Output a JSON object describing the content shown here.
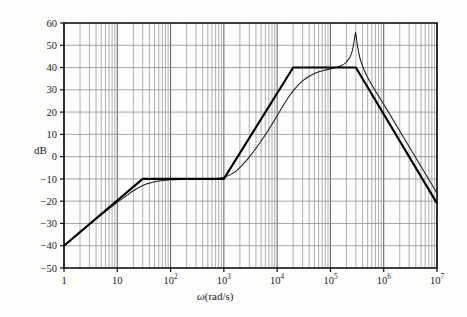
{
  "figure": {
    "kind": "bode-magnitude-plot",
    "background_color": "#fdfdfb",
    "frame_color": "#111111",
    "grid_color": "#8a8a8a",
    "curve_color": "#000000",
    "asymptote_color": "#000000"
  },
  "axes": {
    "y_label": "dB",
    "x_label_omega": "ω",
    "x_label_units": "(rad/s)",
    "y_ticks": [
      "60",
      "50",
      "40",
      "30",
      "20",
      "10",
      "0",
      "−10",
      "−20",
      "−30",
      "−40",
      "−50"
    ],
    "x_tick_labels": [
      {
        "mantissa": "1",
        "exponent": ""
      },
      {
        "mantissa": "10",
        "exponent": ""
      },
      {
        "mantissa": "10",
        "exponent": "2"
      },
      {
        "mantissa": "10",
        "exponent": "3"
      },
      {
        "mantissa": "10",
        "exponent": "4"
      },
      {
        "mantissa": "10",
        "exponent": "5"
      },
      {
        "mantissa": "10",
        "exponent": "6"
      },
      {
        "mantissa": "10",
        "exponent": "7"
      }
    ]
  },
  "chart_data": {
    "type": "line",
    "title": "",
    "xlabel": "ω(rad/s)",
    "ylabel": "dB",
    "xscale": "log",
    "yscale": "linear",
    "xlim": [
      1,
      10000000
    ],
    "ylim": [
      -50,
      60
    ],
    "ytick_values": [
      -50,
      -40,
      -30,
      -20,
      -10,
      0,
      10,
      20,
      30,
      40,
      50,
      60
    ],
    "xtick_values": [
      1,
      10,
      100,
      1000,
      10000,
      100000,
      1000000,
      10000000
    ],
    "grid": true,
    "grid_minor": true,
    "legend": "none",
    "series": [
      {
        "name": "Asymptotic approximation",
        "style": "thick-straight-segments",
        "breakpoints": [
          {
            "x": 1,
            "y": -40
          },
          {
            "x": 30,
            "y": -10
          },
          {
            "x": 1000,
            "y": -10
          },
          {
            "x": 20000,
            "y": 40
          },
          {
            "x": 300000,
            "y": 40
          },
          {
            "x": 10000000,
            "y": -21
          }
        ],
        "slopes_db_per_decade": [
          20,
          0,
          40,
          0,
          -40
        ]
      },
      {
        "name": "Exact magnitude response",
        "style": "thin-smooth",
        "points": [
          {
            "x": 1,
            "y": -40.0
          },
          {
            "x": 2,
            "y": -34.0
          },
          {
            "x": 3,
            "y": -30.5
          },
          {
            "x": 5,
            "y": -26.1
          },
          {
            "x": 8,
            "y": -22.3
          },
          {
            "x": 10,
            "y": -20.5
          },
          {
            "x": 15,
            "y": -17.5
          },
          {
            "x": 20,
            "y": -15.3
          },
          {
            "x": 30,
            "y": -13.0
          },
          {
            "x": 40,
            "y": -11.9
          },
          {
            "x": 60,
            "y": -10.9
          },
          {
            "x": 100,
            "y": -10.4
          },
          {
            "x": 200,
            "y": -10.1
          },
          {
            "x": 400,
            "y": -10.0
          },
          {
            "x": 700,
            "y": -9.8
          },
          {
            "x": 1000,
            "y": -9.3
          },
          {
            "x": 1500,
            "y": -7.4
          },
          {
            "x": 2000,
            "y": -4.8
          },
          {
            "x": 3000,
            "y": -0.2
          },
          {
            "x": 5000,
            "y": 7.0
          },
          {
            "x": 8000,
            "y": 14.5
          },
          {
            "x": 10000,
            "y": 18.4
          },
          {
            "x": 15000,
            "y": 25.3
          },
          {
            "x": 20000,
            "y": 29.5
          },
          {
            "x": 30000,
            "y": 34.0
          },
          {
            "x": 50000,
            "y": 37.3
          },
          {
            "x": 80000,
            "y": 38.9
          },
          {
            "x": 100000,
            "y": 39.4
          },
          {
            "x": 150000,
            "y": 40.6
          },
          {
            "x": 200000,
            "y": 42.5
          },
          {
            "x": 250000,
            "y": 46.5
          },
          {
            "x": 290000,
            "y": 54.5
          },
          {
            "x": 300000,
            "y": 55.0
          },
          {
            "x": 320000,
            "y": 50.0
          },
          {
            "x": 360000,
            "y": 44.0
          },
          {
            "x": 420000,
            "y": 39.5
          },
          {
            "x": 500000,
            "y": 35.5
          },
          {
            "x": 700000,
            "y": 29.5
          },
          {
            "x": 1000000,
            "y": 23.5
          },
          {
            "x": 2000000,
            "y": 11.5
          },
          {
            "x": 4000000,
            "y": -0.5
          },
          {
            "x": 7000000,
            "y": -10.2
          },
          {
            "x": 10000000,
            "y": -16.5
          }
        ],
        "resonant_peak": {
          "x": 300000,
          "y": 55
        }
      }
    ]
  }
}
